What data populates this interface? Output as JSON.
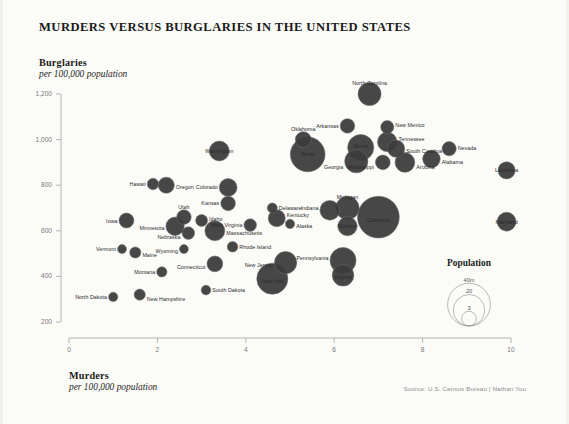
{
  "title": "MURDERS VERSUS BURGLARIES IN THE UNITED STATES",
  "y_axis": {
    "label": "Burglaries",
    "sublabel": "per 100,000 population"
  },
  "x_axis": {
    "label": "Murders",
    "sublabel": "per 100,000 population"
  },
  "source": "Source: U.S. Census Bureau | Nathan You",
  "legend": {
    "title": "Population",
    "items": [
      {
        "label": "40m",
        "value": 40
      },
      {
        "label": "20",
        "value": 20
      },
      {
        "label": "3",
        "value": 3
      }
    ]
  },
  "chart_data": {
    "type": "scatter",
    "title": "MURDERS VERSUS BURGLARIES IN THE UNITED STATES",
    "xlabel": "Murders per 100,000 population",
    "ylabel": "Burglaries per 100,000 population",
    "xlim": [
      0,
      10
    ],
    "ylim": [
      200,
      1200
    ],
    "xticks": [
      0,
      2,
      4,
      6,
      8,
      10
    ],
    "yticks": [
      200,
      400,
      600,
      800,
      1000,
      1200
    ],
    "grid": false,
    "legend_position": "bottom-right",
    "size_encoding": "population (millions)",
    "bubble_color": "#3b3b3b",
    "points": [
      {
        "label": "North Carolina",
        "x": 6.8,
        "y": 1200,
        "pop": 9.5,
        "lx": "c",
        "ly": -11
      },
      {
        "label": "Arkansas",
        "x": 6.3,
        "y": 1060,
        "pop": 2.9,
        "lx": "l",
        "ly": 0
      },
      {
        "label": "New Mexico",
        "x": 7.2,
        "y": 1055,
        "pop": 2.1,
        "lx": "r",
        "ly": -2
      },
      {
        "label": "Tennessee",
        "x": 7.2,
        "y": 990,
        "pop": 6.3,
        "lx": "r",
        "ly": -3
      },
      {
        "label": "South Carolina",
        "x": 7.4,
        "y": 960,
        "pop": 4.6,
        "lx": "r",
        "ly": 2
      },
      {
        "label": "Nevada",
        "x": 8.6,
        "y": 960,
        "pop": 2.7,
        "lx": "r",
        "ly": -1
      },
      {
        "label": "Oklahoma",
        "x": 5.3,
        "y": 1000,
        "pop": 3.7,
        "lx": "c",
        "ly": -11
      },
      {
        "label": "Illinois",
        "x": 6.6,
        "y": 965,
        "pop": 12.9,
        "lx": "c",
        "ly": -2
      },
      {
        "label": "Georgia",
        "x": 6.5,
        "y": 905,
        "pop": 9.7,
        "lx": "l",
        "ly": 6
      },
      {
        "label": "Mississippi",
        "x": 7.1,
        "y": 900,
        "pop": 3.0,
        "lx": "l",
        "ly": 5
      },
      {
        "label": "Arizona",
        "x": 7.6,
        "y": 900,
        "pop": 6.5,
        "lx": "r",
        "ly": 5
      },
      {
        "label": "Alabama",
        "x": 8.2,
        "y": 915,
        "pop": 4.8,
        "lx": "r",
        "ly": 3
      },
      {
        "label": "Texas",
        "x": 5.4,
        "y": 935,
        "pop": 25.1,
        "lx": "c",
        "ly": 0
      },
      {
        "label": "Washington",
        "x": 3.4,
        "y": 950,
        "pop": 6.7,
        "lx": "c",
        "ly": 0
      },
      {
        "label": "Louisiana",
        "x": 9.9,
        "y": 865,
        "pop": 4.5,
        "lx": "c",
        "ly": 0
      },
      {
        "label": "Maryland",
        "x": 9.9,
        "y": 640,
        "pop": 5.8,
        "lx": "c",
        "ly": 0
      },
      {
        "label": "Hawaii",
        "x": 1.9,
        "y": 805,
        "pop": 1.4,
        "lx": "l",
        "ly": 0
      },
      {
        "label": "Oregon",
        "x": 2.2,
        "y": 800,
        "pop": 3.8,
        "lx": "r",
        "ly": 2
      },
      {
        "label": "Colorado",
        "x": 3.6,
        "y": 790,
        "pop": 5.0,
        "lx": "l",
        "ly": 0
      },
      {
        "label": "Kansas",
        "x": 3.6,
        "y": 720,
        "pop": 2.9,
        "lx": "l",
        "ly": 0
      },
      {
        "label": "Delaware",
        "x": 4.6,
        "y": 700,
        "pop": 0.9,
        "lx": "r",
        "ly": 0
      },
      {
        "label": "Indiana",
        "x": 5.9,
        "y": 690,
        "pop": 6.5,
        "lx": "l",
        "ly": -2
      },
      {
        "label": "Michigan",
        "x": 6.3,
        "y": 700,
        "pop": 9.9,
        "lx": "c",
        "ly": -11
      },
      {
        "label": "Missouri",
        "x": 6.3,
        "y": 620,
        "pop": 6.0,
        "lx": "c",
        "ly": 0
      },
      {
        "label": "California",
        "x": 7.0,
        "y": 660,
        "pop": 38.0,
        "lx": "c",
        "ly": 3
      },
      {
        "label": "Iowa",
        "x": 1.3,
        "y": 645,
        "pop": 3.1,
        "lx": "l",
        "ly": 0
      },
      {
        "label": "Utah",
        "x": 2.6,
        "y": 660,
        "pop": 2.9,
        "lx": "c",
        "ly": -10
      },
      {
        "label": "Idaho",
        "x": 3.0,
        "y": 645,
        "pop": 1.6,
        "lx": "r",
        "ly": -2
      },
      {
        "label": "Minnesota",
        "x": 2.4,
        "y": 620,
        "pop": 5.4,
        "lx": "l",
        "ly": 2
      },
      {
        "label": "Nebraska",
        "x": 2.7,
        "y": 590,
        "pop": 1.9,
        "lx": "l",
        "ly": 4
      },
      {
        "label": "Massachusetts",
        "x": 3.3,
        "y": 600,
        "pop": 6.7,
        "lx": "r",
        "ly": 2
      },
      {
        "label": "West Virginia",
        "x": 4.1,
        "y": 625,
        "pop": 1.9,
        "lx": "l",
        "ly": 0
      },
      {
        "label": "Kentucky",
        "x": 4.7,
        "y": 655,
        "pop": 4.4,
        "lx": "r",
        "ly": -3
      },
      {
        "label": "Alaska",
        "x": 5.0,
        "y": 630,
        "pop": 0.7,
        "lx": "r",
        "ly": 2
      },
      {
        "label": "Vermont",
        "x": 1.2,
        "y": 520,
        "pop": 0.6,
        "lx": "l",
        "ly": 0
      },
      {
        "label": "Maine",
        "x": 1.5,
        "y": 505,
        "pop": 1.3,
        "lx": "r",
        "ly": 3
      },
      {
        "label": "Wyoming",
        "x": 2.6,
        "y": 520,
        "pop": 0.6,
        "lx": "l",
        "ly": 2
      },
      {
        "label": "Rhode Island",
        "x": 3.7,
        "y": 530,
        "pop": 1.1,
        "lx": "r",
        "ly": 0
      },
      {
        "label": "Connecticut",
        "x": 3.3,
        "y": 455,
        "pop": 3.6,
        "lx": "l",
        "ly": 3
      },
      {
        "label": "New Jersey",
        "x": 4.9,
        "y": 460,
        "pop": 8.8,
        "lx": "l",
        "ly": 2
      },
      {
        "label": "New York",
        "x": 4.6,
        "y": 390,
        "pop": 19.4,
        "lx": "c",
        "ly": 2
      },
      {
        "label": "Pennsylvania",
        "x": 6.2,
        "y": 470,
        "pop": 12.8,
        "lx": "l",
        "ly": -2
      },
      {
        "label": "Virginia",
        "x": 6.2,
        "y": 405,
        "pop": 8.2,
        "lx": "c",
        "ly": 2
      },
      {
        "label": "Montana",
        "x": 2.1,
        "y": 420,
        "pop": 1.0,
        "lx": "l",
        "ly": 0
      },
      {
        "label": "South Dakota",
        "x": 3.1,
        "y": 340,
        "pop": 0.8,
        "lx": "r",
        "ly": 0
      },
      {
        "label": "North Dakota",
        "x": 1.0,
        "y": 310,
        "pop": 0.7,
        "lx": "l",
        "ly": 0
      },
      {
        "label": "New Hampshire",
        "x": 1.6,
        "y": 320,
        "pop": 1.3,
        "lx": "r",
        "ly": 4
      }
    ]
  }
}
